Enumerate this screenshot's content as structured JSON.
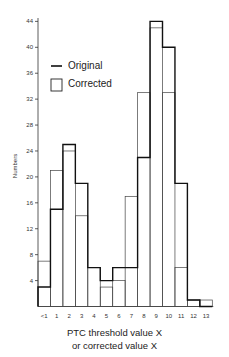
{
  "chart_data": {
    "type": "bar",
    "subtype": "step-histogram-overlay",
    "title": "",
    "xlabel": "PTC threshold value X or corrected value X",
    "xlabel_lines": [
      "PTC threshold value X",
      "or corrected value X"
    ],
    "ylabel": "Numbers",
    "ylim": [
      0,
      45
    ],
    "yticks": [
      4,
      8,
      12,
      16,
      20,
      24,
      28,
      32,
      36,
      40,
      44
    ],
    "categories": [
      "<1",
      "1",
      "2",
      "3",
      "4",
      "5",
      "6",
      "7",
      "8",
      "9",
      "10",
      "11",
      "12",
      "13"
    ],
    "series": [
      {
        "name": "Original",
        "style": "thick-line",
        "values": [
          3,
          15,
          25,
          19,
          6,
          4,
          6,
          6,
          23,
          44,
          40,
          19,
          1,
          0
        ]
      },
      {
        "name": "Corrected",
        "style": "thin-box",
        "values": [
          7,
          21,
          24,
          14,
          6,
          3,
          4,
          17,
          33,
          43,
          33,
          6,
          1,
          1
        ]
      }
    ],
    "legend": [
      "Original",
      "Corrected"
    ],
    "legend_position": "upper-left",
    "grid": false
  },
  "axis": {
    "ylabel": "Numbers",
    "yticks": [
      "4",
      "8",
      "12",
      "16",
      "20",
      "24",
      "28",
      "32",
      "36",
      "40",
      "44"
    ],
    "xticks": [
      "<1",
      "1",
      "2",
      "3",
      "4",
      "5",
      "6",
      "7",
      "8",
      "9",
      "10",
      "11",
      "12",
      "13"
    ]
  },
  "legend": {
    "original": "Original",
    "corrected": "Corrected"
  },
  "xtitle": {
    "line1": "PTC threshold value X",
    "line2": "or corrected value X"
  }
}
